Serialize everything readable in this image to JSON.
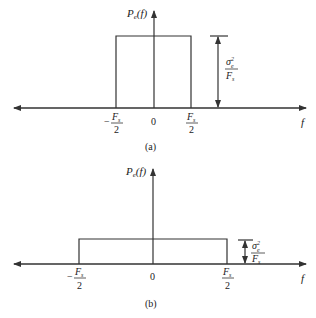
{
  "figure": {
    "panels": [
      {
        "id": "a",
        "caption": "(a)",
        "y_label": {
          "main": "P",
          "sub": "e",
          "arg": "(f)"
        },
        "x_label": "f",
        "ticks": {
          "left_num": "F",
          "left_sub": "s",
          "left_den": "2",
          "left_sign": "−",
          "center": "0",
          "right_num": "F",
          "right_sub": "s",
          "right_den": "2"
        },
        "height_label": {
          "num": "σ",
          "num_sup": "2",
          "num_sub": "e",
          "den": "F",
          "den_sub": "s"
        }
      },
      {
        "id": "b",
        "caption": "(b)",
        "y_label": {
          "main": "P",
          "sub": "e",
          "arg": "(f)"
        },
        "x_label": "f",
        "ticks": {
          "left_num": "F",
          "left_sub": "s",
          "left_den": "2",
          "left_sign": "−",
          "center": "0",
          "right_num": "F",
          "right_sub": "s",
          "right_den": "2"
        },
        "height_label": {
          "num": "σ",
          "num_sup": "2",
          "num_sub": "e",
          "den": "F",
          "den_sub": "s"
        }
      }
    ],
    "colors": {
      "line": "#333333",
      "text": "#222222",
      "background": "#ffffff"
    }
  }
}
